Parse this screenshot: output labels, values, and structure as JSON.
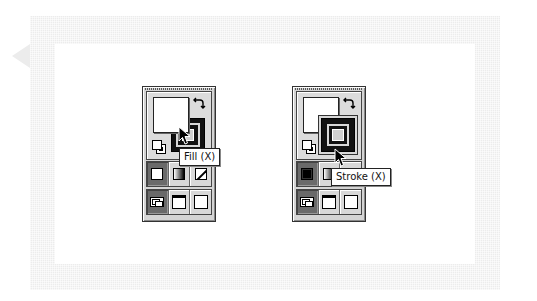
{
  "panels": [
    {
      "id": "fill-active",
      "fill_color": "#ffffff",
      "stroke_color": "#000000",
      "front": "fill",
      "tooltip": "Fill (X)",
      "color_row": [
        "color",
        "gradient",
        "none"
      ],
      "screen_row": [
        "standard-screen",
        "full-screen-with-menu",
        "full-screen"
      ]
    },
    {
      "id": "stroke-active",
      "fill_color": "#ffffff",
      "stroke_color": "#000000",
      "front": "stroke",
      "tooltip": "Stroke (X)",
      "color_row": [
        "color",
        "gradient",
        "none"
      ],
      "screen_row": [
        "standard-screen",
        "full-screen-with-menu",
        "full-screen"
      ]
    }
  ],
  "icons": {
    "swap": "↰↳",
    "swap_glyph": "⤡"
  },
  "colors": {
    "frame": "#ececec",
    "panel_bg": "#d4d4d4",
    "active_cell": "#6a6a6a"
  }
}
